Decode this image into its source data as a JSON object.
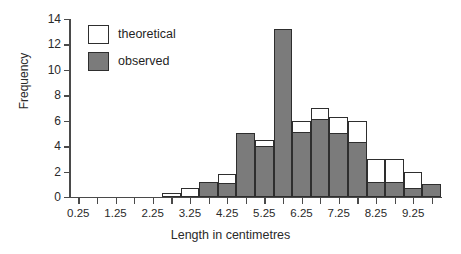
{
  "chart_data": {
    "type": "bar",
    "title": "",
    "xlabel": "Length in centimetres",
    "ylabel": "Frequency",
    "ylim": [
      0,
      14
    ],
    "ytick_values": [
      0,
      2,
      4,
      6,
      8,
      10,
      12,
      14
    ],
    "xtick_labels": [
      "0.25",
      "1.25",
      "2.25",
      "3.25",
      "4.25",
      "5.25",
      "6.25",
      "7.25",
      "8.25",
      "9.25"
    ],
    "xtick_values": [
      0.25,
      1.25,
      2.25,
      3.25,
      4.25,
      5.25,
      6.25,
      7.25,
      8.25,
      9.25
    ],
    "xlim": [
      0.0,
      10.0
    ],
    "bin_width": 0.5,
    "grid": false,
    "legend_position": "top-left",
    "legend": [
      "theoretical",
      "observed"
    ],
    "bin_starts": [
      2.5,
      3.0,
      3.5,
      4.0,
      4.5,
      5.0,
      5.5,
      6.0,
      6.5,
      7.0,
      7.5,
      8.0,
      8.5,
      9.0,
      9.5
    ],
    "series": [
      {
        "name": "theoretical",
        "color": "#ffffff",
        "values": [
          0.3,
          0.7,
          1.2,
          1.8,
          5.0,
          4.5,
          13.2,
          6.0,
          7.0,
          6.3,
          6.0,
          3.0,
          3.0,
          2.0,
          1.0
        ]
      },
      {
        "name": "observed",
        "color": "#7b7b7b",
        "values": [
          0.0,
          0.0,
          1.2,
          1.1,
          5.0,
          4.0,
          13.2,
          5.1,
          6.1,
          5.0,
          4.3,
          1.2,
          1.2,
          0.7,
          1.0
        ]
      }
    ]
  }
}
